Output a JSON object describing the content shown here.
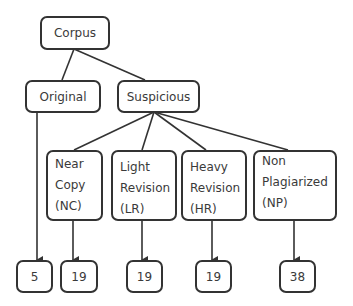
{
  "diagram": {
    "type": "tree",
    "root": {
      "label": "Corpus"
    },
    "level1": [
      {
        "label": "Original"
      },
      {
        "label": "Suspicious"
      }
    ],
    "suspicious_children": [
      {
        "lines": [
          "Near",
          "Copy",
          "(NC)"
        ]
      },
      {
        "lines": [
          "Light",
          "Revision",
          "(LR)"
        ]
      },
      {
        "lines": [
          "Heavy",
          "Revision",
          "(HR)"
        ]
      },
      {
        "lines": [
          "Non",
          "Plagiarized",
          "(NP)"
        ]
      }
    ],
    "counts": [
      {
        "of": "Original",
        "value": "5"
      },
      {
        "of": "NC",
        "value": "19"
      },
      {
        "of": "LR",
        "value": "19"
      },
      {
        "of": "HR",
        "value": "19"
      },
      {
        "of": "NP",
        "value": "38"
      }
    ]
  }
}
